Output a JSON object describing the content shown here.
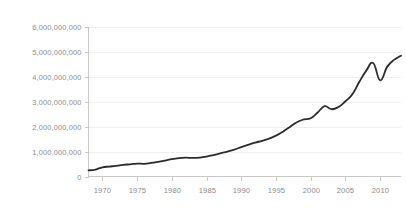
{
  "chart_data": {
    "type": "line",
    "title": "",
    "subtitle": "",
    "xlabel": "",
    "ylabel": "",
    "xlim": [
      1968,
      2013
    ],
    "ylim": [
      0,
      6000000000
    ],
    "grid": true,
    "legend": false,
    "legend_position": "none",
    "line_color": "#2b2b2b",
    "grid_color": "#e8e8e8",
    "axis_color": "#bcbcbc",
    "tick_label_color": "#8c8c8c",
    "background_color": "#ffffff",
    "y_ticks": [
      0,
      1000000000,
      2000000000,
      3000000000,
      4000000000,
      5000000000,
      6000000000
    ],
    "y_tick_labels": [
      "0",
      "1,000,000,000",
      "2,000,000,000",
      "3,000,000,000",
      "4,000,000,000",
      "5,000,000,000",
      "6,000,000,000"
    ],
    "x_ticks": [
      1970,
      1975,
      1980,
      1985,
      1990,
      1995,
      2000,
      2005,
      2010
    ],
    "x_tick_labels": [
      "1970",
      "1975",
      "1980",
      "1985",
      "1990",
      "1995",
      "2000",
      "2005",
      "2010"
    ],
    "series": [
      {
        "name": "value",
        "color": "#2b2b2b",
        "x": [
          1968,
          1969,
          1970,
          1971,
          1972,
          1973,
          1974,
          1975,
          1976,
          1977,
          1978,
          1979,
          1980,
          1981,
          1982,
          1983,
          1984,
          1985,
          1986,
          1987,
          1988,
          1989,
          1990,
          1991,
          1992,
          1993,
          1994,
          1995,
          1996,
          1997,
          1998,
          1999,
          2000,
          2001,
          2002,
          2003,
          2004,
          2005,
          2006,
          2007,
          2008,
          2009,
          2010,
          2011,
          2012,
          2013
        ],
        "values": [
          245000000,
          280000000,
          370000000,
          400000000,
          430000000,
          470000000,
          490000000,
          520000000,
          510000000,
          545000000,
          590000000,
          640000000,
          700000000,
          740000000,
          755000000,
          745000000,
          760000000,
          800000000,
          860000000,
          930000000,
          1000000000,
          1080000000,
          1180000000,
          1270000000,
          1360000000,
          1430000000,
          1520000000,
          1640000000,
          1800000000,
          1990000000,
          2180000000,
          2290000000,
          2340000000,
          2570000000,
          2820000000,
          2700000000,
          2790000000,
          3020000000,
          3300000000,
          3800000000,
          4250000000,
          4550000000,
          3860000000,
          4400000000,
          4680000000,
          4850000000
        ]
      }
    ],
    "annotations": []
  }
}
